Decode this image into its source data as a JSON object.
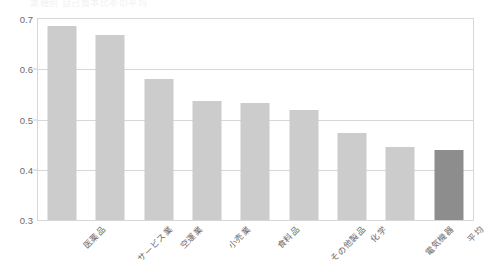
{
  "caption": "業種別  自己資本比率の平均",
  "chart_data": {
    "type": "bar",
    "title": "",
    "subtitle": "",
    "xlabel": "",
    "ylabel": "",
    "ylim": [
      0.3,
      0.7
    ],
    "ytick_step": 0.1,
    "ytick_labels": [
      "0.7",
      "0.6",
      "0.5",
      "0.4",
      "0.3"
    ],
    "ytick_values": [
      0.7,
      0.6,
      0.5,
      0.4,
      0.3
    ],
    "grid": true,
    "legend": "none",
    "categories": [
      "医薬品",
      "サービス業",
      "空運業",
      "小売業",
      "食料品",
      "その他製品",
      "化学",
      "電気機器",
      "平均"
    ],
    "values": [
      0.686,
      0.669,
      0.58,
      0.537,
      0.532,
      0.519,
      0.474,
      0.446,
      0.439
    ],
    "series": [
      {
        "name": "値",
        "values": [
          0.686,
          0.669,
          0.58,
          0.537,
          0.532,
          0.519,
          0.474,
          0.446,
          0.439
        ]
      }
    ],
    "highlight_index": 8,
    "colors": {
      "bar": "#cccccc",
      "bar_highlight": "#8d8d8d",
      "grid": "#d7d7d7",
      "frame": "#d7d7d7",
      "text": "#6b6b6b"
    }
  }
}
